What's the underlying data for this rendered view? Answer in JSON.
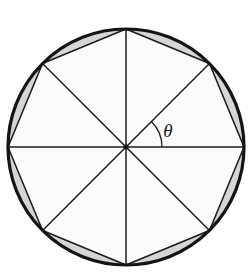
{
  "figure": {
    "background_color": "#ffffff",
    "circle": {
      "name": "outer-circle",
      "center_x": 126,
      "center_y": 147,
      "radius": 118,
      "stroke_color": "#141414",
      "stroke_width": 3.2,
      "fill_color": "#f7f7f7"
    },
    "polygon": {
      "name": "inscribed-regular-octagon",
      "sides": 8,
      "center_x": 126,
      "center_y": 147,
      "circumradius": 118,
      "start_angle_deg": 0,
      "vertex_angles_deg": [
        0,
        45,
        90,
        135,
        180,
        225,
        270,
        315
      ],
      "fill_color": "#fbfbfb",
      "stroke_color": "#1e1e1e",
      "stroke_width": 1.5
    },
    "segments": {
      "name": "circular-segments",
      "count": 8,
      "fill_color": "#cfcfcf",
      "fill_opacity": 0.85,
      "stroke_color": "#2a2a2a",
      "stroke_width": 0.9
    },
    "spokes": {
      "name": "radii-spokes",
      "count": 8,
      "stroke_color": "#1e1e1e",
      "stroke_width": 1.5,
      "angles_deg": [
        0,
        45,
        90,
        135,
        180,
        225,
        270,
        315
      ]
    },
    "center_dot": {
      "name": "center-point",
      "radius": 2.6,
      "fill_color": "#141414"
    },
    "angle_marker": {
      "name": "central-angle-theta",
      "label": "θ",
      "label_x": 168,
      "label_y": 133,
      "arc_radius": 36,
      "start_angle_deg": 0,
      "end_angle_deg": 45,
      "stroke_color": "#1e1e1e",
      "stroke_width": 1.3
    }
  }
}
